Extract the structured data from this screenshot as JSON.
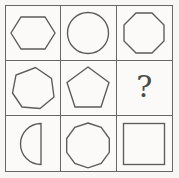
{
  "puzzle": {
    "title": "Shape Matrix Reasoning Puzzle",
    "rows": 3,
    "columns": 3,
    "background_color": "#f8f7f5",
    "grid_line_color": "#676767",
    "shape_stroke_color": "#5b5b5b",
    "missing_cell_marker": "?",
    "cells": [
      {
        "position": "r1c1",
        "shape": "hexagon",
        "sides": 6,
        "label": "Hexagon"
      },
      {
        "position": "r1c2",
        "shape": "circle",
        "sides": 0,
        "label": "Circle"
      },
      {
        "position": "r1c3",
        "shape": "octagon",
        "sides": 8,
        "label": "Octagon"
      },
      {
        "position": "r2c1",
        "shape": "heptagon",
        "sides": 7,
        "label": "Heptagon"
      },
      {
        "position": "r2c2",
        "shape": "pentagon",
        "sides": 5,
        "label": "Pentagon"
      },
      {
        "position": "r2c3",
        "shape": "question-mark",
        "sides": 0,
        "label": "?"
      },
      {
        "position": "r3c1",
        "shape": "semicircle",
        "sides": 0,
        "label": "Semicircle"
      },
      {
        "position": "r3c2",
        "shape": "nonagon",
        "sides": 9,
        "label": "Nonagon"
      },
      {
        "position": "r3c3",
        "shape": "square",
        "sides": 4,
        "label": "Square"
      }
    ]
  }
}
